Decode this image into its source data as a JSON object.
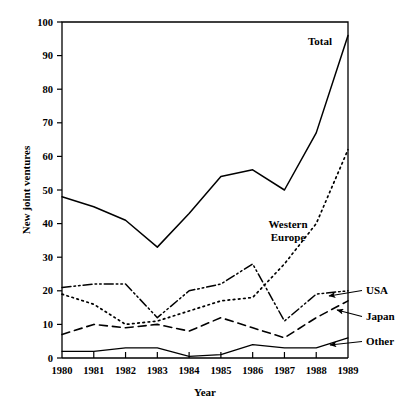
{
  "chart_data": {
    "type": "line",
    "title": "",
    "xlabel": "Year",
    "ylabel": "New joint ventures",
    "categories": [
      "1980",
      "1981",
      "1982",
      "1983",
      "1984",
      "1985",
      "1986",
      "1987",
      "1988",
      "1989"
    ],
    "x": [
      1980,
      1981,
      1982,
      1983,
      1984,
      1985,
      1986,
      1987,
      1988,
      1989
    ],
    "xlim": [
      1980,
      1989
    ],
    "ylim": [
      0,
      100
    ],
    "ytick_labels": [
      "0",
      "10",
      "20",
      "30",
      "40",
      "50",
      "60",
      "70",
      "80",
      "90",
      "100"
    ],
    "yticks": [
      0,
      10,
      20,
      30,
      40,
      50,
      60,
      70,
      80,
      90,
      100
    ],
    "xtick_labels": [
      "1980",
      "1981",
      "1982",
      "1983",
      "1984",
      "1985",
      "1986",
      "1987",
      "1988",
      "1989"
    ],
    "grid": false,
    "legend_position": "inline-annotations",
    "series": [
      {
        "name": "Total",
        "style": "solid",
        "color": "#000000",
        "label": "Total",
        "values": [
          48,
          45,
          41,
          33,
          43,
          54,
          56,
          50,
          67,
          96
        ]
      },
      {
        "name": "Western Europe",
        "style": "dotted",
        "color": "#000000",
        "label": "Western Europe",
        "label_line1": "Western",
        "label_line2": "Europe",
        "values": [
          19,
          16,
          10,
          11,
          14,
          17,
          18,
          28,
          40,
          62
        ]
      },
      {
        "name": "USA",
        "style": "dash-dot-dot",
        "color": "#000000",
        "label": "USA",
        "values": [
          21,
          22,
          22,
          12,
          20,
          22,
          28,
          11,
          19,
          20
        ]
      },
      {
        "name": "Japan",
        "style": "dashed",
        "color": "#000000",
        "label": "Japan",
        "values": [
          7,
          10,
          9,
          10,
          8,
          12,
          9,
          6,
          12,
          17
        ]
      },
      {
        "name": "Other",
        "style": "solid-thin",
        "color": "#000000",
        "label": "Other",
        "values": [
          2,
          2,
          3,
          3,
          0.5,
          1,
          4,
          3,
          3,
          6
        ]
      }
    ],
    "annotations": [
      {
        "text": "Total",
        "series": "Total"
      },
      {
        "text": "Western Europe",
        "series": "Western Europe"
      },
      {
        "text": "USA",
        "series": "USA",
        "arrow": true
      },
      {
        "text": "Japan",
        "series": "Japan",
        "arrow": true
      },
      {
        "text": "Other",
        "series": "Other",
        "arrow": true
      }
    ]
  }
}
